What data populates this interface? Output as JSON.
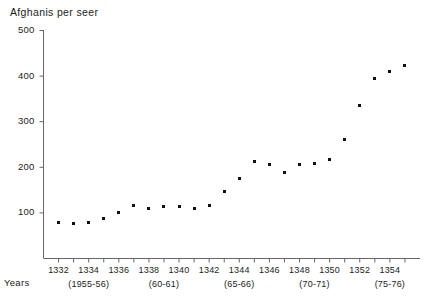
{
  "chart_data": {
    "type": "scatter",
    "title": "Afghanis per seer",
    "xlabel": "Years",
    "ylabel": "",
    "ylim": [
      0,
      500
    ],
    "xlim": [
      1331,
      1356
    ],
    "grid": false,
    "legend": "none",
    "y_ticks": [
      100,
      200,
      300,
      400,
      500
    ],
    "x_ticks": [
      1332,
      1334,
      1336,
      1338,
      1340,
      1342,
      1344,
      1346,
      1348,
      1350,
      1352,
      1354
    ],
    "x_group_labels": [
      {
        "label": "(1955-56)",
        "year": 1334
      },
      {
        "label": "(60-61)",
        "year": 1339
      },
      {
        "label": "(65-66)",
        "year": 1344
      },
      {
        "label": "(70-71)",
        "year": 1349
      },
      {
        "label": "(75-76)",
        "year": 1354
      }
    ],
    "x": [
      1332,
      1333,
      1334,
      1335,
      1336,
      1337,
      1338,
      1339,
      1340,
      1341,
      1342,
      1343,
      1344,
      1345,
      1346,
      1347,
      1348,
      1349,
      1350,
      1351,
      1352,
      1353,
      1354,
      1355
    ],
    "values": [
      78,
      76,
      77,
      86,
      100,
      116,
      108,
      113,
      112,
      108,
      116,
      145,
      175,
      212,
      206,
      187,
      205,
      208,
      215,
      260,
      335,
      393,
      408,
      423
    ],
    "marker": "square",
    "marker_color": "#111111",
    "axis_color": "#555555"
  },
  "axis": {
    "title_text": "Afghanis per seer",
    "years_text": "Years"
  }
}
